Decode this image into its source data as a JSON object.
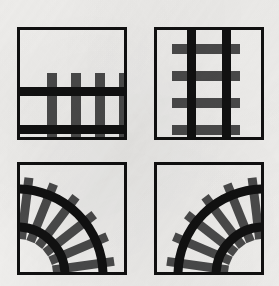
{
  "figure": {
    "background_color": "#f3f2f0",
    "rail_color": "#111111",
    "tie_color": "#4b4b4b",
    "border_color": "#101010",
    "tile_fill": "#f4f3f1",
    "canvas": {
      "width": 279,
      "height": 286
    }
  },
  "panels": [
    {
      "id": "panel-straight-horizontal",
      "name": "straight-horizontal-track",
      "label": "Straight horizontal track",
      "orientation": "horizontal",
      "kind": "straight",
      "x": 17,
      "y": 27,
      "width": 110,
      "height": 113,
      "border_width": 3,
      "rail_count": 2,
      "tie_count": 4,
      "rail_thickness": 9,
      "tie_thickness": 10,
      "rails_y": [
        60,
        98
      ],
      "ties_x": [
        30,
        54,
        78,
        102
      ],
      "tie_start": 46,
      "tie_end": 115
    },
    {
      "id": "panel-straight-vertical",
      "name": "straight-vertical-track",
      "label": "Straight vertical track",
      "orientation": "vertical",
      "kind": "straight",
      "x": 154,
      "y": 27,
      "width": 110,
      "height": 113,
      "border_width": 3,
      "rail_count": 2,
      "tie_count": 4,
      "rail_thickness": 9,
      "tie_thickness": 10,
      "rails_x": [
        33,
        68
      ],
      "ties_y": [
        17,
        44,
        71,
        98
      ],
      "tie_start": 18,
      "tie_end": 86
    },
    {
      "id": "panel-curve-left",
      "name": "curve-track-left",
      "label": "Curved track, centre lower-left",
      "orientation": "curve-bottom-left",
      "kind": "curve",
      "x": 17,
      "y": 162,
      "width": 110,
      "height": 113,
      "border_width": 3,
      "arc_center": [
        0,
        113
      ],
      "arc_radii": [
        48,
        86
      ],
      "rail_thickness": 9,
      "tie_count": 6,
      "tie_thickness": 9,
      "tie_angles_deg": [
        8,
        23,
        38,
        53,
        68,
        83
      ]
    },
    {
      "id": "panel-curve-right",
      "name": "curve-track-right",
      "label": "Curved track, centre lower-right",
      "orientation": "curve-bottom-right",
      "kind": "curve",
      "x": 154,
      "y": 162,
      "width": 110,
      "height": 113,
      "border_width": 3,
      "arc_center": [
        110,
        113
      ],
      "arc_radii": [
        48,
        86
      ],
      "rail_thickness": 9,
      "tie_count": 6,
      "tie_thickness": 9,
      "tie_angles_deg": [
        8,
        23,
        38,
        53,
        68,
        83
      ]
    }
  ]
}
